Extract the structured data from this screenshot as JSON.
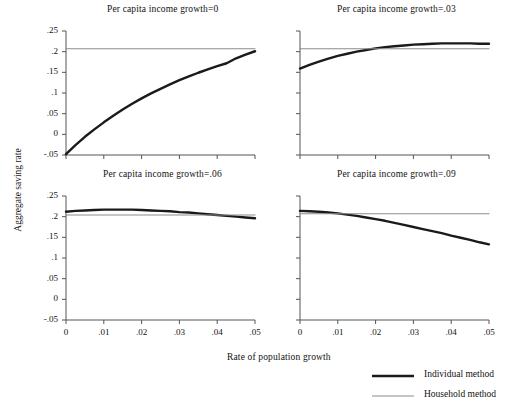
{
  "figure": {
    "xlabel": "Rate of population growth",
    "ylabel": "Aggregate saving rate"
  },
  "legend": {
    "items": [
      {
        "label": "Individual method",
        "color": "#1a1a1a",
        "width": 2.6
      },
      {
        "label": "Household method",
        "color": "#8c8c8c",
        "width": 1.1
      }
    ]
  },
  "chart_data": {
    "type": "line",
    "title": "",
    "xlabel": "Rate of population growth",
    "ylabel": "Aggregate saving rate",
    "xlim": [
      0,
      0.05
    ],
    "ylim": [
      -0.05,
      0.25
    ],
    "xticks": [
      0,
      0.01,
      0.02,
      0.03,
      0.04,
      0.05
    ],
    "xticklabels": [
      "0",
      ".01",
      ".02",
      ".03",
      ".04",
      ".05"
    ],
    "yticks": [
      -0.05,
      0,
      0.05,
      0.1,
      0.15,
      0.2,
      0.25
    ],
    "yticklabels": [
      "-.05",
      "0",
      ".05",
      ".1",
      ".15",
      ".2",
      ".25"
    ],
    "grid": false,
    "legend_position": "lower right outside",
    "panels": [
      {
        "title": "Per capita income growth=0",
        "row": 0,
        "col": 0,
        "show_ytick_labels": true,
        "show_xtick_labels": false,
        "series": [
          {
            "name": "Individual method",
            "color": "#1a1a1a",
            "x": [
              0,
              0.0025,
              0.005,
              0.0075,
              0.01,
              0.0125,
              0.015,
              0.0175,
              0.02,
              0.0225,
              0.025,
              0.0275,
              0.03,
              0.0325,
              0.035,
              0.0375,
              0.04,
              0.0425,
              0.045,
              0.0475,
              0.05
            ],
            "y": [
              -0.048,
              -0.026,
              -0.006,
              0.012,
              0.029,
              0.045,
              0.06,
              0.074,
              0.087,
              0.099,
              0.11,
              0.121,
              0.131,
              0.14,
              0.149,
              0.157,
              0.165,
              0.172,
              0.184,
              0.193,
              0.201
            ]
          },
          {
            "name": "Household method",
            "color": "#8c8c8c",
            "x": [
              0,
              0.05
            ],
            "y": [
              0.207,
              0.207
            ]
          }
        ]
      },
      {
        "title": "Per capita income growth=.03",
        "row": 0,
        "col": 1,
        "show_ytick_labels": false,
        "show_xtick_labels": false,
        "series": [
          {
            "name": "Individual method",
            "color": "#1a1a1a",
            "x": [
              0,
              0.0025,
              0.005,
              0.0075,
              0.01,
              0.0125,
              0.015,
              0.0175,
              0.02,
              0.0225,
              0.025,
              0.0275,
              0.03,
              0.0325,
              0.035,
              0.0375,
              0.04,
              0.0425,
              0.045,
              0.0475,
              0.05
            ],
            "y": [
              0.159,
              0.168,
              0.176,
              0.183,
              0.19,
              0.195,
              0.2,
              0.204,
              0.208,
              0.211,
              0.213,
              0.215,
              0.217,
              0.218,
              0.219,
              0.22,
              0.22,
              0.22,
              0.22,
              0.219,
              0.219
            ]
          },
          {
            "name": "Household method",
            "color": "#8c8c8c",
            "x": [
              0,
              0.05
            ],
            "y": [
              0.207,
              0.207
            ]
          }
        ]
      },
      {
        "title": "Per capita income growth=.06",
        "row": 1,
        "col": 0,
        "show_ytick_labels": true,
        "show_xtick_labels": true,
        "series": [
          {
            "name": "Individual method",
            "color": "#1a1a1a",
            "x": [
              0,
              0.0025,
              0.005,
              0.0075,
              0.01,
              0.0125,
              0.015,
              0.0175,
              0.02,
              0.0225,
              0.025,
              0.0275,
              0.03,
              0.0325,
              0.035,
              0.0375,
              0.04,
              0.0425,
              0.045,
              0.0475,
              0.05
            ],
            "y": [
              0.212,
              0.214,
              0.215,
              0.216,
              0.217,
              0.217,
              0.217,
              0.217,
              0.216,
              0.215,
              0.214,
              0.213,
              0.211,
              0.21,
              0.208,
              0.206,
              0.204,
              0.202,
              0.2,
              0.198,
              0.196
            ]
          },
          {
            "name": "Household method",
            "color": "#8c8c8c",
            "x": [
              0,
              0.05
            ],
            "y": [
              0.204,
              0.204
            ]
          }
        ]
      },
      {
        "title": "Per capita income growth=.09",
        "row": 1,
        "col": 1,
        "show_ytick_labels": false,
        "show_xtick_labels": true,
        "series": [
          {
            "name": "Individual method",
            "color": "#1a1a1a",
            "x": [
              0,
              0.0025,
              0.005,
              0.0075,
              0.01,
              0.0125,
              0.015,
              0.0175,
              0.02,
              0.0225,
              0.025,
              0.0275,
              0.03,
              0.0325,
              0.035,
              0.0375,
              0.04,
              0.0425,
              0.045,
              0.0475,
              0.05
            ],
            "y": [
              0.214,
              0.213,
              0.212,
              0.21,
              0.208,
              0.205,
              0.202,
              0.198,
              0.194,
              0.19,
              0.185,
              0.18,
              0.175,
              0.17,
              0.165,
              0.16,
              0.154,
              0.149,
              0.144,
              0.138,
              0.133
            ]
          },
          {
            "name": "Household method",
            "color": "#8c8c8c",
            "x": [
              0,
              0.05
            ],
            "y": [
              0.207,
              0.207
            ]
          }
        ]
      }
    ]
  }
}
